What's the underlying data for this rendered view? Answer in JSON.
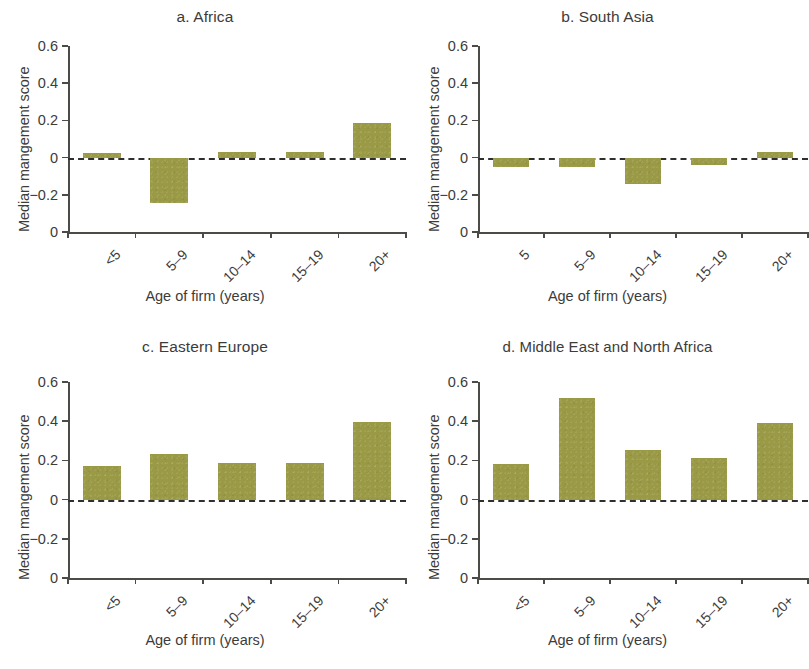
{
  "figure": {
    "background": "#ffffff",
    "bar_color": "#9a9a46",
    "axis_color": "#4b4b48",
    "text_color": "#3c3c3a",
    "shared_xlabel": "Age of firm (years)",
    "shared_ylabel": "Median mangement score",
    "ytick_labels": [
      "0.6",
      "0.4",
      "0.2",
      "0",
      "−0.2",
      "0"
    ],
    "ytick_values": [
      0.6,
      0.4,
      0.2,
      0,
      -0.2,
      -0.4
    ]
  },
  "chart_data": [
    {
      "type": "bar",
      "panel": "a",
      "title": "a. Africa",
      "categories": [
        "<5",
        "5–9",
        "10–14",
        "15–19",
        "20+"
      ],
      "values": [
        0.025,
        -0.245,
        0.03,
        0.03,
        0.185
      ],
      "xlabel": "Age of firm (years)",
      "ylabel": "Median mangement score",
      "ylim": [
        -0.4,
        0.6
      ],
      "yticks": [
        0.6,
        0.4,
        0.2,
        0,
        -0.2,
        -0.4
      ],
      "ytick_labels": [
        "0.6",
        "0.4",
        "0.2",
        "0",
        "−0.2",
        "0"
      ],
      "grid": false,
      "legend": null,
      "zero_reference_line": true
    },
    {
      "type": "bar",
      "panel": "b",
      "title": "b. South Asia",
      "categories": [
        "5",
        "5–9",
        "10–14",
        "15–19",
        "20+"
      ],
      "values": [
        -0.05,
        -0.05,
        -0.14,
        -0.04,
        0.03
      ],
      "xlabel": "Age of firm (years)",
      "ylabel": "Median mangement score",
      "ylim": [
        -0.4,
        0.6
      ],
      "yticks": [
        0.6,
        0.4,
        0.2,
        0,
        -0.2,
        -0.4
      ],
      "ytick_labels": [
        "0.6",
        "0.4",
        "0.2",
        "0",
        "−0.2",
        "0"
      ],
      "grid": false,
      "legend": null,
      "zero_reference_line": true
    },
    {
      "type": "bar",
      "panel": "c",
      "title": "c. Eastern Europe",
      "categories": [
        "<5",
        "5–9",
        "10–14",
        "15–19",
        "20+"
      ],
      "values": [
        0.17,
        0.235,
        0.185,
        0.185,
        0.395
      ],
      "xlabel": "Age of firm (years)",
      "ylabel": "Median mangement score",
      "ylim": [
        -0.4,
        0.6
      ],
      "yticks": [
        0.6,
        0.4,
        0.2,
        0,
        -0.2,
        -0.4
      ],
      "ytick_labels": [
        "0.6",
        "0.4",
        "0.2",
        "0",
        "−0.2",
        "0"
      ],
      "grid": false,
      "legend": null,
      "zero_reference_line": true
    },
    {
      "type": "bar",
      "panel": "d",
      "title": "d. Middle East and North Africa",
      "categories": [
        "<5",
        "5–9",
        "10–14",
        "15–19",
        "20+"
      ],
      "values": [
        0.18,
        0.52,
        0.255,
        0.21,
        0.39
      ],
      "xlabel": "Age of firm (years)",
      "ylabel": "Median mangement score",
      "ylim": [
        -0.4,
        0.6
      ],
      "yticks": [
        0.6,
        0.4,
        0.2,
        0,
        -0.2,
        -0.4
      ],
      "ytick_labels": [
        "0.6",
        "0.4",
        "0.2",
        "0",
        "−0.2",
        "0"
      ],
      "grid": false,
      "legend": null,
      "zero_reference_line": true
    }
  ]
}
